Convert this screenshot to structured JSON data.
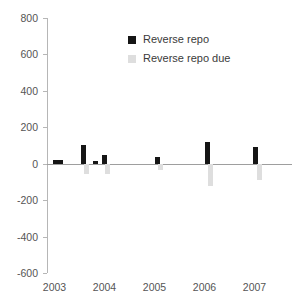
{
  "legend": {
    "position": "top-center",
    "entries": [
      {
        "label": "Reverse repo",
        "color": "#151515",
        "key": "reverse_repo"
      },
      {
        "label": "Reverse repo due",
        "color": "#dedede",
        "key": "reverse_repo_due"
      }
    ]
  },
  "axes": {
    "y_ticks": [
      "800",
      "600",
      "400",
      "200",
      "0",
      "-200",
      "-400",
      "-600"
    ],
    "x_ticks": [
      "2003",
      "2004",
      "2005",
      "2006",
      "2007"
    ]
  },
  "chart_data": {
    "type": "bar",
    "title": "",
    "xlabel": "",
    "ylabel": "",
    "ylim": [
      -600,
      800
    ],
    "ytick_values": [
      800,
      600,
      400,
      200,
      0,
      -200,
      -400,
      -600
    ],
    "xlim": [
      2002.85,
      2007.75
    ],
    "xtick_values": [
      2003,
      2004,
      2005,
      2006,
      2007
    ],
    "grid": false,
    "colors": {
      "reverse_repo": "#151515",
      "reverse_repo_due": "#dedede"
    },
    "series": [
      {
        "name": "Reverse repo",
        "color": "#151515",
        "points": [
          {
            "x": 2003.02,
            "value": 18
          },
          {
            "x": 2003.12,
            "value": 20
          },
          {
            "x": 2003.58,
            "value": 105
          },
          {
            "x": 2003.82,
            "value": 15
          },
          {
            "x": 2004.0,
            "value": 50
          },
          {
            "x": 2005.05,
            "value": 35
          },
          {
            "x": 2006.05,
            "value": 120
          },
          {
            "x": 2007.02,
            "value": 90
          }
        ]
      },
      {
        "name": "Reverse repo due",
        "color": "#dedede",
        "points": [
          {
            "x": 2003.64,
            "value": -55
          },
          {
            "x": 2004.06,
            "value": -58
          },
          {
            "x": 2005.12,
            "value": -32
          },
          {
            "x": 2006.12,
            "value": -125
          },
          {
            "x": 2007.09,
            "value": -92
          }
        ]
      }
    ]
  }
}
